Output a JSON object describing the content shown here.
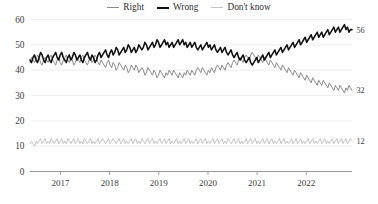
{
  "legend": {
    "position": "top-center",
    "items": [
      {
        "label": "Right",
        "color": "#8a8a8a",
        "swatch_icon": "line-swatch-icon"
      },
      {
        "label": "Wrong",
        "color": "#111111",
        "swatch_icon": "line-swatch-icon"
      },
      {
        "label": "Don't know",
        "color": "#c3c3c3",
        "swatch_icon": "line-swatch-icon"
      }
    ]
  },
  "axes": {
    "y_ticks": [
      "0",
      "10",
      "20",
      "30",
      "40",
      "50",
      "60"
    ],
    "x_ticks": [
      "2017",
      "2018",
      "2019",
      "2020",
      "2021",
      "2022"
    ]
  },
  "end_labels": {
    "wrong": "56",
    "right": "32",
    "dont_know": "12"
  },
  "chart_data": {
    "type": "line",
    "title": "",
    "subtitle": "",
    "xlabel": "",
    "ylabel": "",
    "ylim": [
      0,
      60
    ],
    "xlim": [
      "2016-07",
      "2022-12"
    ],
    "grid": true,
    "grid_axis": "y",
    "legend_position": "top-center",
    "x_tick_labels": [
      "2017",
      "2018",
      "2019",
      "2020",
      "2021",
      "2022"
    ],
    "y_tick_labels": [
      "0",
      "10",
      "20",
      "30",
      "40",
      "50",
      "60"
    ],
    "y_tick_values": [
      0,
      10,
      20,
      30,
      40,
      50,
      60
    ],
    "annotations": [
      {
        "text": "56",
        "series": "Wrong",
        "at": "series-end"
      },
      {
        "text": "32",
        "series": "Right",
        "at": "series-end"
      },
      {
        "text": "12",
        "series": "Don't know",
        "at": "series-end"
      }
    ],
    "series": [
      {
        "name": "Right",
        "color": "#8a8a8a",
        "end_value": 32,
        "values": [
          43,
          45,
          44,
          43,
          44,
          46,
          45,
          43,
          42,
          44,
          45,
          44,
          43,
          45,
          46,
          44,
          43,
          42,
          44,
          45,
          43,
          42,
          44,
          45,
          46,
          44,
          43,
          45,
          44,
          42,
          43,
          45,
          44,
          43,
          45,
          46,
          44,
          43,
          42,
          44,
          45,
          43,
          44,
          46,
          45,
          43,
          42,
          44,
          43,
          42,
          41,
          43,
          44,
          42,
          41,
          43,
          42,
          40,
          41,
          43,
          42,
          41,
          40,
          42,
          41,
          39,
          40,
          42,
          41,
          40,
          42,
          41,
          39,
          40,
          41,
          40,
          38,
          39,
          41,
          40,
          39,
          38,
          40,
          39,
          37,
          38,
          40,
          39,
          38,
          37,
          39,
          38,
          40,
          39,
          38,
          40,
          39,
          38,
          37,
          39,
          38,
          37,
          39,
          38,
          40,
          39,
          38,
          40,
          39,
          38,
          40,
          41,
          40,
          39,
          41,
          40,
          39,
          38,
          40,
          39,
          41,
          40,
          39,
          41,
          42,
          41,
          40,
          42,
          41,
          40,
          42,
          43,
          42,
          41,
          43,
          44,
          43,
          42,
          44,
          45,
          44,
          43,
          45,
          46,
          45,
          44,
          46,
          47,
          46,
          45,
          44,
          46,
          45,
          44,
          43,
          45,
          44,
          43,
          42,
          44,
          43,
          42,
          41,
          43,
          42,
          41,
          40,
          42,
          41,
          40,
          39,
          41,
          40,
          39,
          38,
          40,
          39,
          38,
          37,
          39,
          38,
          37,
          36,
          38,
          37,
          36,
          35,
          37,
          36,
          35,
          34,
          36,
          35,
          34,
          36,
          35,
          34,
          33,
          35,
          34,
          33,
          32,
          34,
          33,
          32,
          34,
          33,
          32,
          31,
          33,
          32,
          34,
          33,
          32
        ]
      },
      {
        "name": "Wrong",
        "color": "#111111",
        "end_value": 56,
        "values": [
          44,
          43,
          45,
          46,
          44,
          43,
          45,
          47,
          46,
          44,
          43,
          45,
          46,
          44,
          43,
          45,
          46,
          47,
          45,
          44,
          46,
          47,
          45,
          44,
          43,
          45,
          46,
          44,
          45,
          47,
          46,
          44,
          45,
          46,
          44,
          43,
          45,
          46,
          47,
          45,
          44,
          46,
          45,
          43,
          44,
          46,
          47,
          45,
          46,
          47,
          48,
          46,
          45,
          47,
          48,
          46,
          47,
          49,
          48,
          46,
          47,
          48,
          49,
          47,
          48,
          50,
          49,
          47,
          48,
          49,
          47,
          48,
          50,
          49,
          48,
          49,
          51,
          50,
          48,
          49,
          50,
          51,
          49,
          50,
          52,
          51,
          49,
          50,
          51,
          52,
          50,
          51,
          49,
          50,
          51,
          49,
          50,
          51,
          52,
          50,
          51,
          52,
          50,
          51,
          49,
          50,
          51,
          49,
          50,
          51,
          49,
          48,
          49,
          50,
          48,
          49,
          50,
          51,
          49,
          50,
          48,
          49,
          50,
          48,
          47,
          48,
          49,
          47,
          48,
          49,
          47,
          46,
          47,
          48,
          46,
          45,
          46,
          47,
          45,
          44,
          45,
          46,
          44,
          43,
          44,
          45,
          43,
          42,
          43,
          44,
          45,
          43,
          44,
          45,
          46,
          44,
          45,
          46,
          47,
          45,
          46,
          47,
          48,
          46,
          47,
          48,
          49,
          47,
          48,
          49,
          50,
          48,
          49,
          50,
          51,
          49,
          50,
          51,
          52,
          50,
          51,
          52,
          53,
          51,
          52,
          53,
          54,
          52,
          53,
          54,
          55,
          53,
          54,
          55,
          53,
          54,
          55,
          56,
          54,
          55,
          56,
          57,
          55,
          56,
          57,
          55,
          56,
          57,
          58,
          56,
          57,
          55,
          56,
          56
        ]
      },
      {
        "name": "Don't know",
        "color": "#c3c3c3",
        "end_value": 12,
        "values": [
          11,
          12,
          11,
          10,
          12,
          11,
          12,
          13,
          11,
          12,
          13,
          11,
          12,
          11,
          13,
          12,
          11,
          12,
          13,
          11,
          12,
          13,
          11,
          12,
          11,
          13,
          12,
          11,
          12,
          13,
          11,
          12,
          13,
          11,
          12,
          11,
          13,
          12,
          11,
          12,
          13,
          11,
          12,
          11,
          12,
          13,
          11,
          12,
          13,
          12,
          11,
          12,
          13,
          11,
          12,
          13,
          12,
          11,
          12,
          13,
          11,
          12,
          13,
          11,
          12,
          11,
          12,
          13,
          11,
          12,
          13,
          11,
          12,
          11,
          13,
          12,
          11,
          12,
          13,
          11,
          12,
          13,
          11,
          12,
          11,
          12,
          13,
          11,
          12,
          13,
          11,
          12,
          13,
          11,
          12,
          11,
          12,
          13,
          11,
          12,
          11,
          12,
          13,
          11,
          12,
          13,
          11,
          12,
          11,
          12,
          13,
          11,
          12,
          13,
          11,
          12,
          13,
          11,
          12,
          11,
          12,
          13,
          11,
          12,
          13,
          11,
          12,
          13,
          11,
          12,
          11,
          13,
          12,
          11,
          12,
          13,
          11,
          12,
          13,
          11,
          12,
          11,
          12,
          13,
          11,
          12,
          13,
          11,
          12,
          13,
          11,
          12,
          11,
          12,
          13,
          11,
          12,
          13,
          11,
          12,
          13,
          11,
          12,
          11,
          12,
          13,
          11,
          12,
          13,
          11,
          12,
          11,
          12,
          13,
          11,
          12,
          13,
          11,
          12,
          13,
          11,
          12,
          11,
          12,
          13,
          11,
          12,
          13,
          11,
          12,
          11,
          12,
          13,
          11,
          12,
          13,
          11,
          12,
          11,
          12,
          13,
          11,
          12,
          13,
          11,
          12,
          13,
          11,
          12,
          13,
          11,
          12,
          13,
          12
        ]
      }
    ]
  }
}
